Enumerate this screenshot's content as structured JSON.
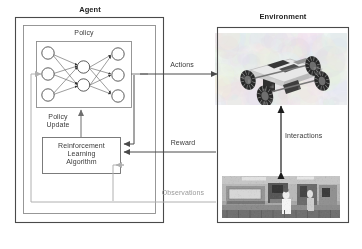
{
  "diagram": {
    "agent": {
      "title": "Agent",
      "policy_label": "Policy",
      "policy_update_label": "Policy\nUpdate",
      "algorithm_label": "Reinforcement\nLearning\nAlgorithm",
      "network": {
        "input_nodes": 3,
        "hidden_nodes": 2,
        "output_nodes": 3
      }
    },
    "environment": {
      "title": "Environment",
      "interactions_label": "Interactions",
      "robot_caption": "rover-photo",
      "lab_caption": "laboratory-photo"
    },
    "signals": {
      "actions": "Actions",
      "reward": "Reward",
      "observations": "Observations"
    },
    "colors": {
      "stroke_dark": "#4a4a4a",
      "stroke_mid": "#6e6e6e",
      "stroke_light": "#b6b6b6",
      "text": "#3a3a3a",
      "text_faint": "#9a9a9a",
      "background": "#ffffff"
    }
  }
}
